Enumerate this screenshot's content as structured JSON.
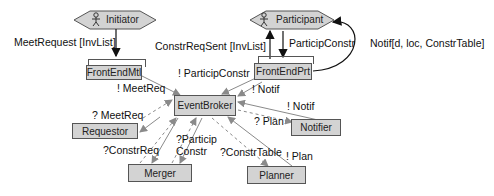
{
  "actors": {
    "initiator": "Initiator",
    "participant": "Participant"
  },
  "components": {
    "front_end_mtl": "FrontEndMtl",
    "front_end_prt": "FrontEndPrt",
    "event_broker": "EventBroker",
    "requestor": "Requestor",
    "notifier": "Notifier",
    "merger": "Merger",
    "planner": "Planner"
  },
  "edges": {
    "meet_request": "MeetRequest [InvList]",
    "constr_req_sent": "ConstrReqSent [InvList]",
    "particip_constr": "ParticipConstr",
    "notif_participant": "Notif[d, loc, ConstrTable]",
    "emit_meet_req": "! MeetReq",
    "emit_particip_constr": "! ParticipConstr",
    "emit_notif_prt": "! Notif",
    "emit_notif_notifier": "! Notif",
    "recv_meet_req": "? MeetReq",
    "recv_plan": "? Plan",
    "recv_constr_req": "?ConstrReq",
    "recv_particip_constr_1": "?Particip",
    "recv_particip_constr_2": "Constr",
    "recv_constr_table": "?ConstrTable",
    "emit_plan": "! Plan"
  },
  "colors": {
    "box_fill": "#d3d3d3",
    "box_border": "#555555",
    "arrow_gray": "#8a8a8a",
    "arrow_black": "#111111"
  }
}
